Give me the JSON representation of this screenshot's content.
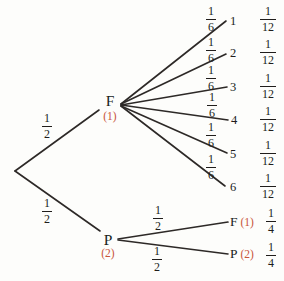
{
  "diagram": {
    "type": "probability-tree",
    "colors": {
      "background": "#fdfdfb",
      "line": "#2d2927",
      "text": "#201d1b",
      "accent": "#c8553a"
    },
    "root": {
      "up_prob": {
        "num": "1",
        "den": "2"
      },
      "down_prob": {
        "num": "1",
        "den": "2"
      }
    },
    "nodes": {
      "f": {
        "label": "F",
        "tag": "(1)"
      },
      "p": {
        "label": "P",
        "tag": "(2)"
      }
    },
    "f_branches": [
      {
        "prob": {
          "num": "1",
          "den": "6"
        },
        "outcome": "1",
        "result": {
          "num": "1",
          "den": "12"
        }
      },
      {
        "prob": {
          "num": "1",
          "den": "6"
        },
        "outcome": "2",
        "result": {
          "num": "1",
          "den": "12"
        }
      },
      {
        "prob": {
          "num": "1",
          "den": "6"
        },
        "outcome": "3",
        "result": {
          "num": "1",
          "den": "12"
        }
      },
      {
        "prob": {
          "num": "1",
          "den": "6"
        },
        "outcome": "4",
        "result": {
          "num": "1",
          "den": "12"
        }
      },
      {
        "prob": {
          "num": "1",
          "den": "6"
        },
        "outcome": "5",
        "result": {
          "num": "1",
          "den": "12"
        }
      },
      {
        "prob": {
          "num": "1",
          "den": "6"
        },
        "outcome": "6",
        "result": {
          "num": "1",
          "den": "12"
        }
      }
    ],
    "p_branches": [
      {
        "prob": {
          "num": "1",
          "den": "2"
        },
        "outcome": "F",
        "tag": "(1)",
        "result": {
          "num": "1",
          "den": "4"
        }
      },
      {
        "prob": {
          "num": "1",
          "den": "2"
        },
        "outcome": "P",
        "tag": "(2)",
        "result": {
          "num": "1",
          "den": "4"
        }
      }
    ]
  }
}
